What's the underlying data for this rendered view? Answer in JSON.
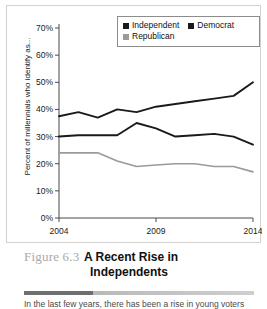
{
  "figure": {
    "number": "Figure 6.3",
    "title_line1": "A Recent Rise in",
    "title_line2": "Independents",
    "body_text": "In the last few years, there has been a rise in young voters who"
  },
  "legend": {
    "items": [
      {
        "label": "Independent",
        "color": "#1a1a1a",
        "swatch": "legend-swatch-independent"
      },
      {
        "label": "Democrat",
        "color": "#1a1a1a",
        "swatch": "legend-swatch-democrat"
      },
      {
        "label": "Republican",
        "color": "#9a9a9a",
        "swatch": "legend-swatch-republican"
      }
    ]
  },
  "chart_data": {
    "type": "line",
    "title": "A Recent Rise in Independents",
    "xlabel": "",
    "ylabel": "Percent of millennials who identify as...",
    "xlim": [
      2004,
      2014
    ],
    "ylim": [
      0,
      70
    ],
    "grid": false,
    "legend_position": "top-right",
    "x": [
      2004,
      2005,
      2006,
      2007,
      2008,
      2009,
      2010,
      2011,
      2012,
      2013,
      2014
    ],
    "xticks": [
      2004,
      2009,
      2014
    ],
    "xtick_labels": [
      "2004",
      "2009",
      "2014"
    ],
    "yticks": [
      0,
      10,
      20,
      30,
      40,
      50,
      60,
      70
    ],
    "ytick_labels": [
      "0%",
      "10%",
      "20%",
      "30%",
      "40%",
      "50%",
      "60%",
      "70%"
    ],
    "series": [
      {
        "name": "Independent",
        "color": "#1a1a1a",
        "values": [
          37.5,
          39,
          37,
          40,
          39,
          41,
          42,
          43,
          44,
          45,
          50
        ]
      },
      {
        "name": "Democrat",
        "color": "#1a1a1a",
        "values": [
          30,
          30.5,
          30.5,
          30.5,
          35,
          33,
          30,
          30.5,
          31,
          30,
          27
        ]
      },
      {
        "name": "Republican",
        "color": "#9a9a9a",
        "values": [
          24,
          24,
          24,
          21,
          19,
          19.5,
          20,
          20,
          19,
          19,
          17
        ]
      }
    ]
  }
}
